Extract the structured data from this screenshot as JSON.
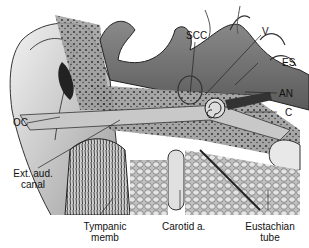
{
  "figure": {
    "labels": {
      "scc": "SCC",
      "v": "V",
      "es": "ES",
      "an": "AN",
      "c": "C",
      "oc": "OC",
      "ext_aud_canal_1": "Ext. aud.",
      "ext_aud_canal_2": "canal",
      "tympanic_1": "Tympanic",
      "tympanic_2": "memb",
      "carotid": "Carotid a.",
      "eustachian_1": "Eustachian",
      "eustachian_2": "tube"
    }
  }
}
